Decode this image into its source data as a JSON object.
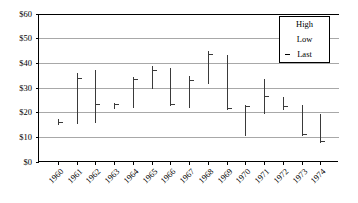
{
  "chart_data": {
    "type": "bar",
    "subtype": "high-low-last (OHLC-style vertical range bars)",
    "title": "",
    "xlabel": "",
    "ylabel": "",
    "ylim": [
      0,
      60
    ],
    "ytick_step": 10,
    "ytick_labels": [
      "$0",
      "$10",
      "$20",
      "$30",
      "$40",
      "$50",
      "$60"
    ],
    "ytick_values": [
      0,
      10,
      20,
      30,
      40,
      50,
      60
    ],
    "grid": true,
    "grid_axis": "y",
    "legend": {
      "position": "top-right-inside",
      "entries": [
        {
          "label": "High",
          "marker": "none"
        },
        {
          "label": "Low",
          "marker": "none"
        },
        {
          "label": "Last",
          "marker": "dash",
          "prefix": "-"
        }
      ]
    },
    "categories": [
      "1960",
      "1961",
      "1962",
      "1963",
      "1964",
      "1965",
      "1966",
      "1967",
      "1968",
      "1969",
      "1970",
      "1971",
      "1972",
      "1973",
      "1974"
    ],
    "series": [
      {
        "name": "High",
        "values": [
          17.5,
          36.0,
          37.5,
          24.0,
          34.5,
          39.0,
          38.0,
          35.0,
          45.0,
          43.5,
          23.0,
          33.5,
          26.5,
          23.0,
          19.5
        ]
      },
      {
        "name": "Low",
        "values": [
          15.0,
          15.5,
          16.0,
          21.5,
          22.0,
          29.5,
          22.5,
          22.0,
          31.5,
          21.0,
          10.5,
          19.5,
          21.0,
          10.5,
          7.5
        ]
      },
      {
        "name": "Last",
        "values": [
          16.0,
          34.0,
          23.5,
          23.5,
          33.5,
          37.0,
          23.5,
          33.0,
          43.5,
          21.5,
          22.5,
          26.5,
          22.5,
          11.0,
          8.5
        ]
      }
    ]
  },
  "legend_box": {
    "high_label": "High",
    "low_label": "Low",
    "last_label": "Last",
    "last_prefix": "-"
  }
}
